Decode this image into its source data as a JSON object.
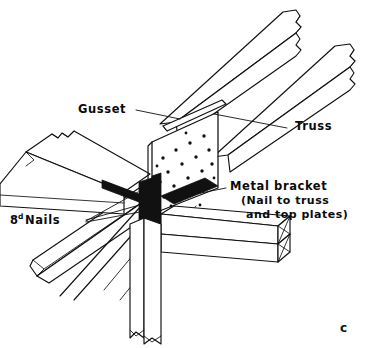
{
  "figure": {
    "caption_letter": "c"
  },
  "labels": {
    "gusset": {
      "text": "Gusset",
      "x": 78,
      "y": 113
    },
    "truss": {
      "text": "Truss",
      "x": 295,
      "y": 130
    },
    "nails": {
      "text": "Nails",
      "prefix_number": "8",
      "prefix_super": "d",
      "x": 10,
      "y": 224
    },
    "metal_bracket": {
      "line1": "Metal bracket",
      "line2": "(Nail to truss",
      "line3": "and top plates)",
      "x": 230,
      "y": 190
    }
  },
  "colors": {
    "ink": "#111111",
    "paper": "#ffffff"
  },
  "components": [
    {
      "name": "upper-truss-chord",
      "note": "upper diagonal truss member, broken end"
    },
    {
      "name": "lower-truss-chord",
      "note": "lower diagonal truss member, broken end"
    },
    {
      "name": "gusset-plate",
      "note": "stippled plate with nail holes"
    },
    {
      "name": "metal-bracket",
      "note": "dark metal connector at joint"
    },
    {
      "name": "top-plates",
      "note": "double top plate, isometric with braced end"
    },
    {
      "name": "wall-stud",
      "note": "vertical stud below joint"
    },
    {
      "name": "left-top-plate",
      "note": "top plate running to left edge, broken end"
    },
    {
      "name": "lower-diagonal-brace",
      "note": "diagonal member to lower left"
    }
  ]
}
